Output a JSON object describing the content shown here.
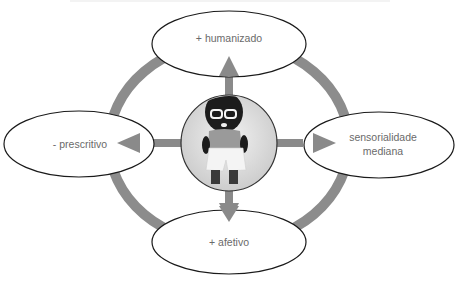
{
  "diagram": {
    "colors": {
      "ring": "#8c8c8c",
      "arrow": "#8a8a8a",
      "ellipse_stroke": "#1a1a1a",
      "ellipse_fill": "#ffffff",
      "text": "#6a6a6a"
    },
    "center": {
      "image_alt": "crocheted doll with glasses"
    },
    "nodes": {
      "top": {
        "label": "+ humanizado"
      },
      "left": {
        "label": "- prescritivo"
      },
      "right": {
        "label_line1": "sensorialidade",
        "label_line2": "mediana"
      },
      "bottom": {
        "label": "+ afetivo"
      }
    }
  }
}
